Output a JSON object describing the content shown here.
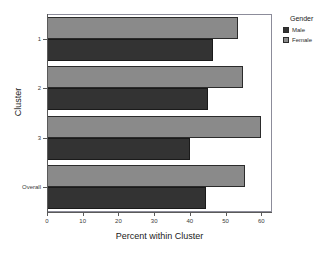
{
  "chart_data": {
    "type": "bar",
    "orientation": "horizontal",
    "title": "",
    "xlabel": "Percent within Cluster",
    "ylabel": "Cluster",
    "categories": [
      "1",
      "2",
      "3",
      "Overall"
    ],
    "series": [
      {
        "name": "Male",
        "color": "#333333",
        "values": [
          46.5,
          45.0,
          40.0,
          44.5
        ]
      },
      {
        "name": "Female",
        "color": "#8a8a8a",
        "values": [
          53.5,
          55.0,
          60.0,
          55.5
        ]
      }
    ],
    "xlim": [
      0,
      63
    ],
    "xticks": [
      0,
      10,
      20,
      30,
      40,
      50,
      60
    ],
    "xtick_labels": [
      "0",
      "10",
      "20",
      "30",
      "40",
      "50",
      "60"
    ],
    "grid": false,
    "legend": {
      "title": "Gender",
      "position": "right",
      "entries": [
        "Male",
        "Female"
      ]
    }
  },
  "axes": {
    "x_title": "Percent within Cluster",
    "y_title": "Cluster"
  },
  "legend": {
    "title": "Gender",
    "items": [
      {
        "label": "Male",
        "color": "#333333"
      },
      {
        "label": "Female",
        "color": "#8a8a8a"
      }
    ]
  }
}
